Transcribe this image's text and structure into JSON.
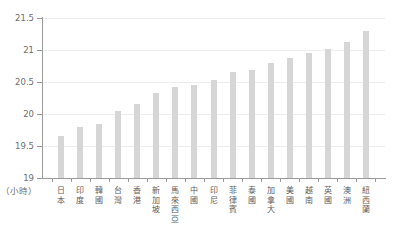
{
  "chart_data": {
    "type": "bar",
    "title": "",
    "xlabel": "",
    "ylabel": "",
    "unit_label": "（小時）",
    "grid": true,
    "legend": "none",
    "ylim": [
      19,
      21.5
    ],
    "yticks": [
      "19",
      "19.5",
      "20",
      "20.5",
      "21",
      "21.5"
    ],
    "ytick_values": [
      19,
      19.5,
      20,
      20.5,
      21,
      21.5
    ],
    "categories": [
      "日本",
      "印度",
      "韓國",
      "台灣",
      "香港",
      "新加坡",
      "馬來西亞",
      "中國",
      "印尼",
      "菲律賓",
      "泰國",
      "加拿大",
      "美國",
      "越南",
      "英國",
      "澳洲",
      "紐西蘭"
    ],
    "values": [
      19.65,
      19.8,
      19.85,
      20.05,
      20.15,
      20.33,
      20.42,
      20.45,
      20.53,
      20.65,
      20.68,
      20.8,
      20.87,
      20.95,
      21.02,
      21.12,
      21.3
    ],
    "bar_color": "#d6d6d6",
    "grid_color": "#ededed",
    "axis_color": "#9a9a9a"
  }
}
